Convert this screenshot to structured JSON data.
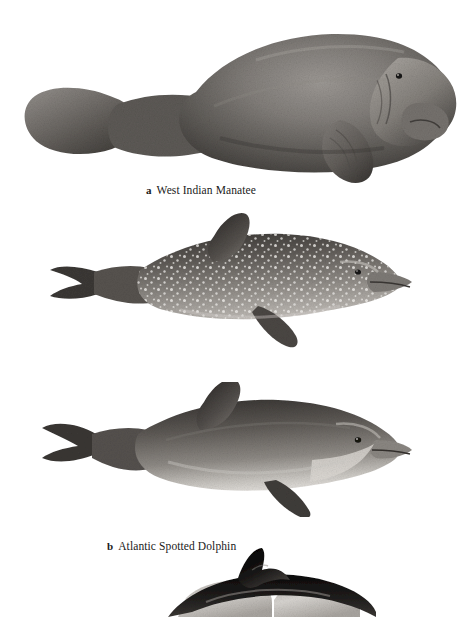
{
  "plate": {
    "title": "Marine mammals comparative plate",
    "background_color": "#ffffff",
    "width": 469,
    "height": 617,
    "style": "grayscale scientific pen-and-ink illustration"
  },
  "figures": [
    {
      "label": "a",
      "name": "West Indian Manatee",
      "caption": "West Indian Manatee",
      "body_color": "#6e6a66",
      "shadow_color": "#3b3835",
      "highlight_color": "#b9b5b0",
      "bounds": {
        "x": 25,
        "y": 30,
        "width": 430,
        "height": 152
      },
      "features": [
        "paddle tail",
        "blunt snout",
        "small eye",
        "wrinkled skin",
        "front flipper"
      ]
    },
    {
      "label": "b",
      "name": "Atlantic Spotted Dolphin",
      "caption": "Atlantic Spotted Dolphin",
      "body_color": "#6b6764",
      "shadow_color": "#332f2d",
      "highlight_color": "#d8d5d1",
      "spot_color": "#f2f0ed",
      "bounds": {
        "x": 50,
        "y": 218,
        "width": 355,
        "height": 130
      },
      "features": [
        "white spots",
        "curved dorsal fin",
        "long beak",
        "tail flukes",
        "flipper"
      ]
    },
    {
      "label": "c",
      "name": "Bottle-nosed Dolphin",
      "caption": "Bottle-nosed Dolphin",
      "body_color": "#6a6663",
      "shadow_color": "#2f2c2a",
      "highlight_color": "#cfccc8",
      "belly_color": "#e2e0dc",
      "bounds": {
        "x": 40,
        "y": 390,
        "width": 365,
        "height": 125
      },
      "features": [
        "short thick beak",
        "pale belly",
        "tall dorsal fin",
        "tail flukes"
      ]
    },
    {
      "label": "d",
      "name": "Common Dolphin",
      "caption": "",
      "body_color": "#151413",
      "shadow_color": "#000000",
      "highlight_color": "#e6e3df",
      "bounds": {
        "x": 160,
        "y": 548,
        "width": 210,
        "height": 69
      },
      "features": [
        "black dorsal fin",
        "dark cape",
        "pale flank patches",
        "cropped at bottom edge"
      ],
      "cropped": true
    }
  ]
}
